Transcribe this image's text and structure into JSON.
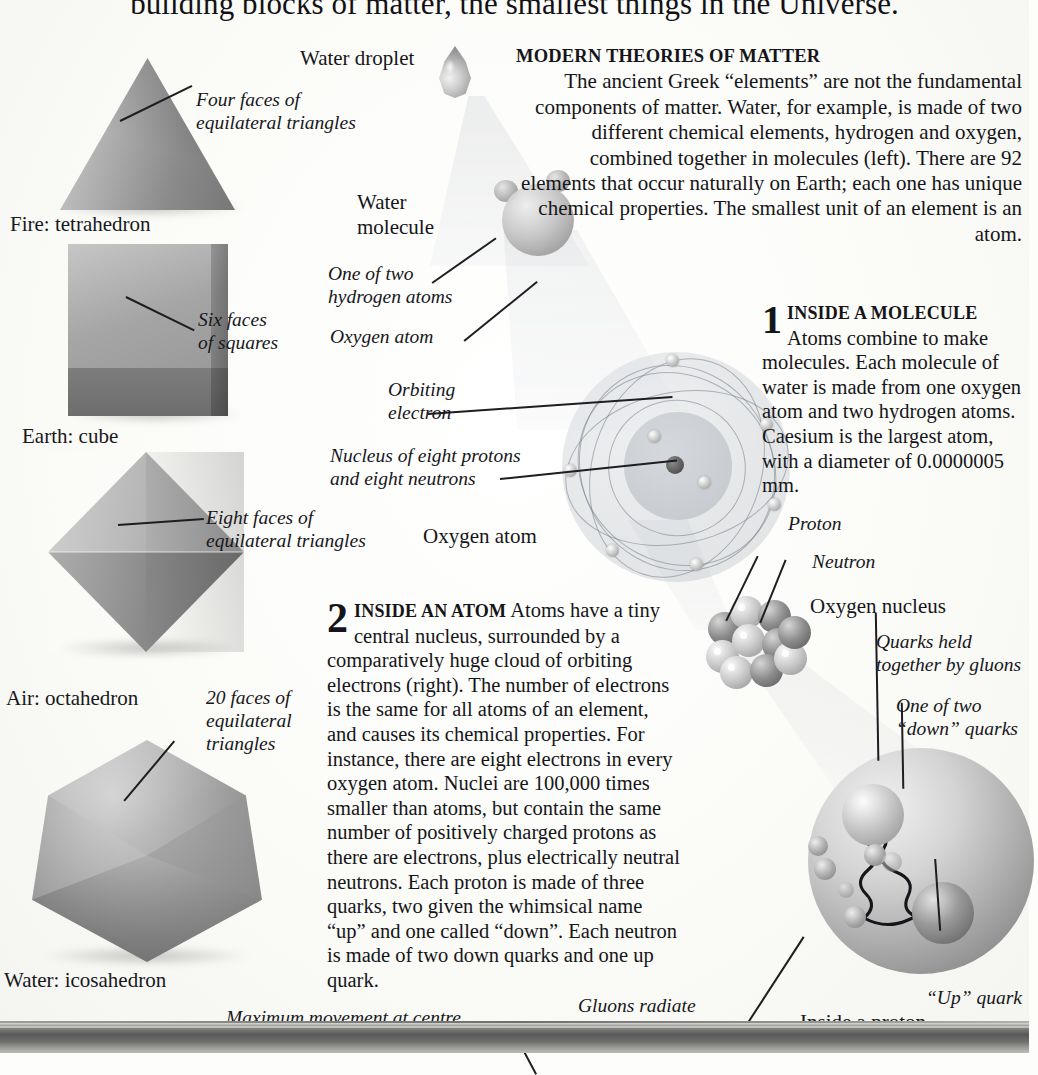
{
  "page": {
    "title": "building blocks of matter, the smallest things in the Universe."
  },
  "solids": [
    {
      "name": "Fire: tetrahedron",
      "callout": "Four faces of\nequilateral triangles"
    },
    {
      "name": "Earth: cube",
      "callout": "Six faces\nof squares"
    },
    {
      "name": "Air: octahedron",
      "callout": "Eight faces of\nequilateral triangles"
    },
    {
      "name": "Water: icosahedron",
      "callout": "20 faces of\nequilateral\ntriangles"
    }
  ],
  "modern": {
    "heading": "MODERN THEORIES OF MATTER",
    "body": "The ancient Greek “elements” are not the fundamental components of matter. Water, for example, is made of two different chemical elements, hydrogen and oxygen, combined together in molecules (left). There are 92 elements that occur naturally on Earth; each one has unique chemical properties. The smallest unit of an element is an atom."
  },
  "steps": [
    {
      "number": "1",
      "heading": "INSIDE A MOLECULE",
      "body": "Atoms combine to make molecules. Each molecule of water is made from one oxygen atom and two hydrogen atoms. Caesium is the largest atom, with a diameter of 0.0000005 mm."
    },
    {
      "number": "2",
      "heading": "INSIDE AN ATOM",
      "body": "Atoms have a tiny central nucleus, surrounded by a comparatively huge cloud of orbiting electrons (right). The number of electrons is the same for all atoms of an element, and causes its chemical properties. For instance, there are eight electrons in every oxygen atom. Nuclei are 100,000 times smaller than atoms, but contain the same number of positively charged protons as there are electrons, plus electrically neutral neutrons. Each proton is made of three quarks, two given the whimsical name “up” and one called “down”. Each neutron is made of two down quarks and one up quark."
    }
  ],
  "labels": {
    "water_droplet": "Water droplet",
    "water_molecule": "Water\nmolecule",
    "hydrogen_atoms": "One of two\nhydrogen atoms",
    "oxygen_atom_italic": "Oxygen atom",
    "orbiting_electron": "Orbiting\nelectron",
    "nucleus_of_eight": "Nucleus of eight protons\nand eight neutrons",
    "oxygen_atom_caption": "Oxygen atom",
    "proton": "Proton",
    "neutron": "Neutron",
    "oxygen_nucleus": "Oxygen nucleus",
    "quarks_gluons": "Quarks held\ntogether by gluons",
    "down_quarks": "One of two\n“down” quarks",
    "up_quark": "“Up” quark",
    "inside_proton": "Inside a proton",
    "maximum_movement": "Maximum movement at centre",
    "gluons_radiate": "Gluons radiate\nanti-quarks momentarily"
  },
  "colors": {
    "page_background": "#fdfdfb",
    "ink": "#16161a",
    "solid_grey": "#9d9d9d",
    "beam_grey": "#bfc4cc",
    "bottom_bar": "#58585a"
  }
}
